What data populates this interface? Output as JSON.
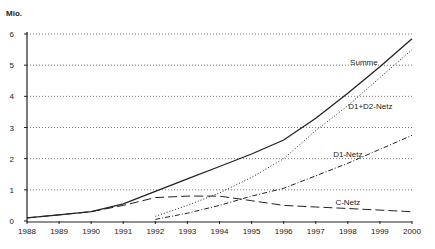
{
  "chart_data": {
    "type": "line",
    "title": "",
    "unit_label": "Mio.",
    "xlabel": "",
    "ylabel": "Mio.",
    "ylim": [
      0,
      6
    ],
    "yticks": [
      0,
      1,
      2,
      3,
      4,
      5,
      6
    ],
    "x": [
      1988,
      1989,
      1990,
      1991,
      1992,
      1993,
      1994,
      1995,
      1996,
      1997,
      1998,
      1999,
      2000
    ],
    "grid": "horizontal dotted",
    "legend": "inline labels",
    "series": [
      {
        "name": "Summe",
        "style": "solid",
        "x": [
          1988,
          1989,
          1990,
          1991,
          1992,
          1993,
          1994,
          1995,
          1996,
          1997,
          1998,
          1999,
          2000
        ],
        "values": [
          0.1,
          0.2,
          0.3,
          0.55,
          0.95,
          1.35,
          1.75,
          2.15,
          2.6,
          3.3,
          4.1,
          4.95,
          5.85
        ]
      },
      {
        "name": "D1+D2-Netz",
        "style": "dotted",
        "x": [
          1992,
          1993,
          1994,
          1995,
          1996,
          1997,
          1998,
          1999,
          2000
        ],
        "values": [
          0.15,
          0.5,
          0.9,
          1.4,
          2.0,
          2.9,
          3.7,
          4.6,
          5.5
        ]
      },
      {
        "name": "D1-Netz",
        "style": "dash-dot",
        "x": [
          1992,
          1993,
          1994,
          1995,
          1996,
          1997,
          1998,
          1999,
          2000
        ],
        "values": [
          0.05,
          0.25,
          0.5,
          0.8,
          1.05,
          1.45,
          1.85,
          2.3,
          2.75
        ]
      },
      {
        "name": "C-Netz",
        "style": "long-dash",
        "x": [
          1988,
          1989,
          1990,
          1991,
          1992,
          1993,
          1994,
          1995,
          1996,
          1997,
          1998,
          1999,
          2000
        ],
        "values": [
          0.1,
          0.2,
          0.3,
          0.5,
          0.75,
          0.8,
          0.8,
          0.65,
          0.5,
          0.45,
          0.4,
          0.35,
          0.3
        ]
      }
    ],
    "annotations": [
      {
        "text": "Summe",
        "x": 1998.5,
        "y": 5.0
      },
      {
        "text": "D1+D2-Netz",
        "x": 1998.7,
        "y": 3.6
      },
      {
        "text": "D1-Netz",
        "x": 1998.0,
        "y": 2.05
      },
      {
        "text": "C-Netz",
        "x": 1998.0,
        "y": 0.5
      }
    ]
  }
}
